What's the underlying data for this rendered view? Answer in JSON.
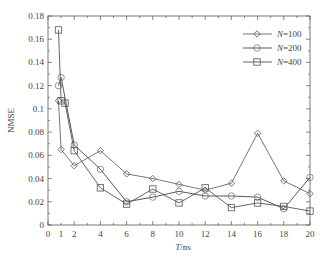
{
  "chart_data": {
    "type": "line",
    "title": "",
    "xlabel": "T/ns",
    "ylabel": "NMSE",
    "xlim": [
      0,
      20
    ],
    "ylim": [
      0,
      0.18
    ],
    "xticks": [
      0,
      1,
      2,
      4,
      6,
      8,
      10,
      12,
      14,
      16,
      18,
      20
    ],
    "yticks": [
      0,
      0.02,
      0.04,
      0.06,
      0.08,
      0.1,
      0.12,
      0.14,
      0.16,
      0.18
    ],
    "ytick_labels": [
      "0",
      "0.02",
      "0.04",
      "0.06",
      "0.08",
      "0.1",
      "0.12",
      "0.14",
      "0.16",
      "0.18"
    ],
    "legend_position": "upper right",
    "series": [
      {
        "name": "N=100",
        "marker": "diamond",
        "x": [
          0.8,
          1,
          2,
          4,
          6,
          8,
          10,
          12,
          14,
          16,
          18,
          20
        ],
        "values": [
          0.107,
          0.065,
          0.051,
          0.064,
          0.044,
          0.04,
          0.035,
          0.03,
          0.036,
          0.079,
          0.038,
          0.027
        ]
      },
      {
        "name": "N=200",
        "marker": "circle",
        "x": [
          0.8,
          1,
          2,
          4,
          6,
          8,
          10,
          12,
          14,
          16,
          18,
          20
        ],
        "values": [
          0.12,
          0.127,
          0.069,
          0.048,
          0.02,
          0.024,
          0.029,
          0.025,
          0.025,
          0.024,
          0.014,
          0.041
        ]
      },
      {
        "name": "N=400",
        "marker": "square",
        "x": [
          0.8,
          1,
          1.3,
          2,
          4,
          6,
          8,
          10,
          12,
          14,
          16,
          18,
          20
        ],
        "values": [
          0.168,
          0.107,
          0.105,
          0.064,
          0.032,
          0.018,
          0.031,
          0.019,
          0.032,
          0.015,
          0.019,
          0.016,
          0.012
        ]
      }
    ]
  }
}
